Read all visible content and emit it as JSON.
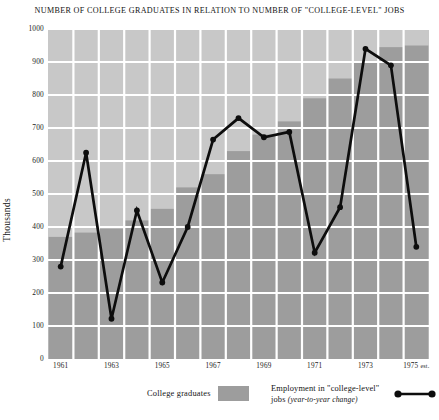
{
  "chart_data": {
    "type": "bar",
    "title": "NUMBER OF COLLEGE GRADUATES IN RELATION TO NUMBER OF \"COLLEGE-LEVEL\" JOBS",
    "xlabel": "",
    "ylabel": "Thousands",
    "ylim": [
      0,
      1000
    ],
    "xlim": [
      1960.5,
      1975.5
    ],
    "grid": true,
    "legend_position": "bottom",
    "y_ticks": [
      0,
      100,
      200,
      300,
      400,
      500,
      600,
      700,
      800,
      900,
      1000
    ],
    "x_tick_labels": [
      "1961",
      "1963",
      "1965",
      "1967",
      "1969",
      "1971",
      "1973",
      "1975"
    ],
    "x_last_tick_suffix": "est.",
    "categories": [
      1961,
      1962,
      1963,
      1964,
      1965,
      1966,
      1967,
      1968,
      1969,
      1970,
      1971,
      1972,
      1973,
      1974,
      1975
    ],
    "series": [
      {
        "name": "College graduates",
        "type": "bar",
        "color": "#9d9d9d",
        "values": [
          370,
          383,
          395,
          420,
          455,
          520,
          560,
          630,
          680,
          720,
          790,
          850,
          900,
          945,
          950
        ]
      },
      {
        "name": "Employment in \"college-level\" jobs (year-to-year change)",
        "type": "line",
        "color": "#0d0d0d",
        "values": [
          280,
          625,
          122,
          450,
          232,
          400,
          665,
          730,
          672,
          688,
          322,
          460,
          940,
          890,
          340
        ]
      }
    ],
    "annotations": []
  },
  "legend": {
    "bars_label": "College graduates",
    "line_label_main": "Employment in \"college-level\"",
    "line_label_sub_prefix": "jobs",
    "line_label_sub": "(year-to-year change)"
  },
  "colors": {
    "bar_fill": "#9d9d9d",
    "plot_background": "#c8c8c8",
    "grid_line": "#ffffff",
    "line_stroke": "#0d0d0d",
    "text": "#141414"
  }
}
